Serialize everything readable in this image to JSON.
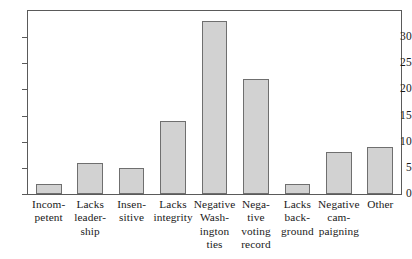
{
  "chart_data": {
    "type": "bar",
    "title": "",
    "subtitle": "",
    "xlabel": "",
    "ylabel": "",
    "ylim": [
      0,
      35
    ],
    "grid": false,
    "legend": null,
    "yticks": [
      0,
      5,
      10,
      15,
      20,
      25,
      30
    ],
    "ytick_labels": [
      "0",
      "5",
      "10",
      "15",
      "20",
      "25",
      "30"
    ],
    "categories": [
      "Incompetent",
      "Lacks leadership",
      "Insensitive",
      "Lacks integrity",
      "Negative Washington ties",
      "Negative voting record",
      "Lacks background",
      "Negative campaigning",
      "Other"
    ],
    "category_label_lines": [
      [
        "Incom-",
        "petent"
      ],
      [
        "Lacks",
        "leader-",
        "ship"
      ],
      [
        "Insen-",
        "sitive"
      ],
      [
        "Lacks",
        "integrity"
      ],
      [
        "Negative",
        "Wash-",
        "ington",
        "ties"
      ],
      [
        "Nega-",
        "tive",
        "voting",
        "record"
      ],
      [
        "Lacks",
        "back-",
        "ground"
      ],
      [
        "Negative",
        "cam-",
        "paigning"
      ],
      [
        "Other"
      ]
    ],
    "values": [
      2,
      6,
      5,
      14,
      33,
      22,
      2,
      8,
      9
    ],
    "colors": {
      "bar_fill": "#d2d2d2",
      "bar_border": "#6f6f6f",
      "axis": "#5a5a5a",
      "text": "#1a1a1a",
      "background": "#ffffff"
    }
  }
}
